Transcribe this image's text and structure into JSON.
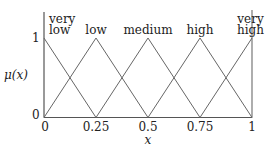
{
  "chart_data": {
    "type": "line",
    "title": "",
    "xlabel": "x",
    "ylabel": "μ(x)",
    "xlim": [
      0,
      1
    ],
    "ylim": [
      0,
      1
    ],
    "grid": false,
    "x_ticks": [
      "0",
      "0.25",
      "0.5",
      "0.75",
      "1"
    ],
    "y_ticks": [
      "0",
      "1"
    ],
    "series": [
      {
        "name": "very low",
        "x": [
          0,
          0.25
        ],
        "values": [
          1,
          0
        ]
      },
      {
        "name": "low",
        "x": [
          0,
          0.25,
          0.5
        ],
        "values": [
          0,
          1,
          0
        ]
      },
      {
        "name": "medium",
        "x": [
          0.25,
          0.5,
          0.75
        ],
        "values": [
          0,
          1,
          0
        ]
      },
      {
        "name": "high",
        "x": [
          0.5,
          0.75,
          1
        ],
        "values": [
          0,
          1,
          0
        ]
      },
      {
        "name": "very high",
        "x": [
          0.75,
          1
        ],
        "values": [
          0,
          1
        ]
      }
    ],
    "set_labels": [
      {
        "line1": "very",
        "line2": "low",
        "x": 0
      },
      {
        "line1": "",
        "line2": "low",
        "x": 0.25
      },
      {
        "line1": "",
        "line2": "medium",
        "x": 0.5
      },
      {
        "line1": "",
        "line2": "high",
        "x": 0.75
      },
      {
        "line1": "very",
        "line2": "high",
        "x": 1
      }
    ],
    "line_color": "#666666",
    "axis_color": "#555555"
  }
}
